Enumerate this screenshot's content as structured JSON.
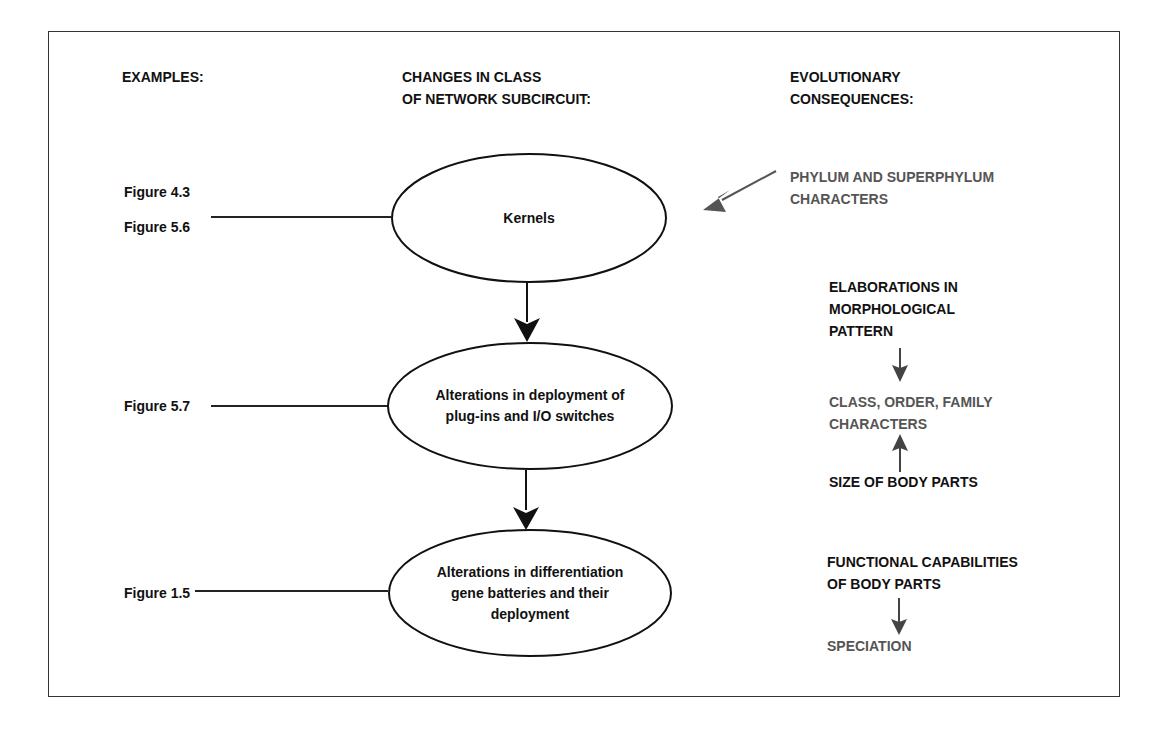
{
  "headers": {
    "examples": "EXAMPLES:",
    "changes_line1": "CHANGES IN CLASS",
    "changes_line2": "OF NETWORK SUBCIRCUIT:",
    "consequences_line1": "EVOLUTIONARY",
    "consequences_line2": "CONSEQUENCES:"
  },
  "examples": {
    "fig_4_3": "Figure 4.3",
    "fig_5_6": "Figure 5.6",
    "fig_5_7": "Figure 5.7",
    "fig_1_5": "Figure 1.5"
  },
  "nodes": [
    {
      "id": "kernels",
      "lines": [
        "Kernels"
      ]
    },
    {
      "id": "plugins",
      "lines": [
        "Alterations in deployment of",
        "plug-ins and I/O switches"
      ]
    },
    {
      "id": "gene-batteries",
      "lines": [
        "Alterations in differentiation",
        "gene batteries and their",
        "deployment"
      ]
    }
  ],
  "consequences": {
    "phylum_line1": "PHYLUM AND SUPERPHYLUM",
    "phylum_line2": "CHARACTERS",
    "elaborations_line1": "ELABORATIONS IN",
    "elaborations_line2": "MORPHOLOGICAL",
    "elaborations_line3": "PATTERN",
    "class_line1": "CLASS, ORDER, FAMILY",
    "class_line2": "CHARACTERS",
    "size": "SIZE OF BODY PARTS",
    "functional_line1": "FUNCTIONAL CAPABILITIES",
    "functional_line2": "OF BODY PARTS",
    "speciation": "SPECIATION"
  },
  "colors": {
    "primary_text": "#111111",
    "secondary_text": "#555555",
    "stroke": "#111111"
  }
}
